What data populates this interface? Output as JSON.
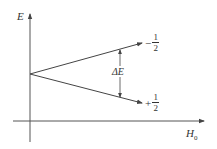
{
  "diagram": {
    "type": "energy-level-splitting",
    "axes": {
      "y_label": "E",
      "x_label": "H",
      "x_label_subscript": "0"
    },
    "levels": [
      {
        "name": "upper",
        "sign": "−",
        "numerator": "1",
        "denominator": "2"
      },
      {
        "name": "lower",
        "sign": "+",
        "numerator": "1",
        "denominator": "2"
      }
    ],
    "gap_label": "ΔE",
    "colors": {
      "line": "#444444",
      "text": "#333333",
      "background": "#ffffff"
    }
  }
}
